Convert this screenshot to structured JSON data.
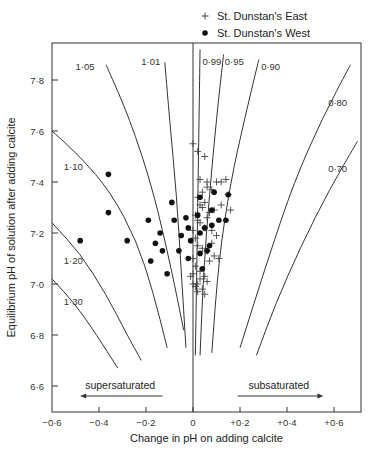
{
  "chart_data": {
    "type": "scatter",
    "title": "",
    "xlabel": "Change in pH on adding calcite",
    "ylabel": "Equilibrium pH of solution after adding calcite",
    "xlim": [
      -0.6,
      0.7
    ],
    "ylim": [
      6.49,
      7.94
    ],
    "x_ticks": [
      -0.6,
      -0.4,
      -0.2,
      0,
      0.2,
      0.4,
      0.6
    ],
    "x_tick_labels": [
      "−0·6",
      "−0·4",
      "−0·2",
      "0",
      "+0·2",
      "+0·4",
      "+0·6"
    ],
    "y_ticks": [
      6.6,
      6.8,
      7.0,
      7.2,
      7.4,
      7.6,
      7.8
    ],
    "y_tick_labels": [
      "6·6",
      "6·8",
      "7·0",
      "7·2",
      "7·4",
      "7·6",
      "7·8"
    ],
    "grid": false,
    "legend": {
      "position": "top-right, above plot",
      "entries": [
        {
          "marker": "+",
          "label": "St. Dunstan's East"
        },
        {
          "marker": "●",
          "label": "St. Dunstan's West"
        }
      ]
    },
    "annotations": [
      {
        "text": "supersaturated",
        "arrow": "left",
        "x": -0.3,
        "y": 6.6
      },
      {
        "text": "subsaturated",
        "arrow": "right",
        "x": 0.35,
        "y": 6.6
      }
    ],
    "saturation_curves": [
      {
        "label": "1·05",
        "points": [
          [
            -0.37,
            7.86
          ],
          [
            -0.27,
            7.65
          ],
          [
            -0.17,
            7.37
          ],
          [
            -0.09,
            7.05
          ],
          [
            -0.04,
            6.82
          ]
        ]
      },
      {
        "label": "1·01",
        "points": [
          [
            -0.12,
            7.87
          ],
          [
            -0.1,
            7.65
          ],
          [
            -0.07,
            7.35
          ],
          [
            -0.05,
            7.05
          ],
          [
            -0.03,
            6.75
          ]
        ]
      },
      {
        "label": "1·10",
        "points": [
          [
            -0.6,
            7.6
          ],
          [
            -0.48,
            7.5
          ],
          [
            -0.35,
            7.36
          ],
          [
            -0.24,
            7.17
          ],
          [
            -0.17,
            6.97
          ],
          [
            -0.11,
            6.75
          ]
        ]
      },
      {
        "label": "1·20",
        "points": [
          [
            -0.6,
            7.24
          ],
          [
            -0.48,
            7.12
          ],
          [
            -0.37,
            6.96
          ],
          [
            -0.28,
            6.8
          ],
          [
            -0.22,
            6.7
          ]
        ]
      },
      {
        "label": "1·30",
        "points": [
          [
            -0.6,
            7.02
          ],
          [
            -0.5,
            6.92
          ],
          [
            -0.41,
            6.8
          ],
          [
            -0.32,
            6.67
          ]
        ]
      },
      {
        "label": "0·99",
        "points": [
          [
            0.03,
            7.92
          ],
          [
            0.025,
            7.6
          ],
          [
            0.02,
            7.3
          ],
          [
            0.015,
            7.0
          ],
          [
            0.01,
            6.72
          ]
        ]
      },
      {
        "label": "0·95",
        "points": [
          [
            0.13,
            7.9
          ],
          [
            0.1,
            7.65
          ],
          [
            0.07,
            7.35
          ],
          [
            0.045,
            7.05
          ],
          [
            0.03,
            6.72
          ]
        ]
      },
      {
        "label": "0·90",
        "points": [
          [
            0.28,
            7.88
          ],
          [
            0.22,
            7.65
          ],
          [
            0.16,
            7.4
          ],
          [
            0.11,
            7.1
          ],
          [
            0.08,
            6.73
          ]
        ]
      },
      {
        "label": "0·80",
        "points": [
          [
            0.67,
            7.86
          ],
          [
            0.55,
            7.65
          ],
          [
            0.43,
            7.4
          ],
          [
            0.32,
            7.1
          ],
          [
            0.2,
            6.75
          ]
        ]
      },
      {
        "label": "0·70",
        "points": [
          [
            0.7,
            7.56
          ],
          [
            0.58,
            7.37
          ],
          [
            0.46,
            7.15
          ],
          [
            0.35,
            6.92
          ],
          [
            0.27,
            6.72
          ]
        ]
      }
    ],
    "series": [
      {
        "name": "St. Dunstan's East",
        "marker": "+",
        "x": [
          0.0,
          0.02,
          0.05,
          0.06,
          0.03,
          0.04,
          0.06,
          0.08,
          0.1,
          0.12,
          0.14,
          0.16,
          0.15,
          0.02,
          0.03,
          0.04,
          0.05,
          0.07,
          0.09,
          0.12,
          0.01,
          0.02,
          0.03,
          0.05,
          0.06,
          0.08,
          0.1,
          0.0,
          0.01,
          0.02,
          0.04,
          0.06,
          0.08,
          0.11,
          0.0,
          0.01,
          0.03,
          0.05,
          0.07,
          0.09,
          0.0,
          0.02,
          0.04,
          0.06,
          0.01,
          0.03,
          -0.01,
          0.02,
          0.0,
          0.05
        ],
        "y": [
          7.55,
          7.52,
          7.5,
          7.38,
          7.41,
          7.36,
          7.4,
          7.37,
          7.4,
          7.4,
          7.41,
          7.29,
          7.35,
          7.34,
          7.31,
          7.3,
          7.32,
          7.28,
          7.29,
          7.31,
          7.27,
          7.25,
          7.24,
          7.22,
          7.26,
          7.21,
          7.19,
          7.21,
          7.18,
          7.15,
          7.14,
          7.13,
          7.16,
          7.1,
          7.1,
          7.07,
          7.05,
          7.03,
          7.09,
          7.11,
          7.04,
          7.0,
          6.98,
          7.01,
          6.99,
          7.02,
          7.03,
          6.97,
          7.0,
          6.96
        ]
      },
      {
        "name": "St. Dunstan's West",
        "marker": "●",
        "x": [
          -0.48,
          -0.36,
          -0.36,
          -0.28,
          -0.19,
          -0.18,
          -0.16,
          -0.14,
          -0.13,
          -0.11,
          -0.09,
          -0.08,
          -0.06,
          -0.05,
          -0.03,
          -0.02,
          -0.02,
          -0.01,
          0.02,
          0.03,
          0.03,
          0.03,
          0.04,
          0.05,
          0.06,
          0.07,
          0.08,
          0.08,
          0.09,
          0.11,
          0.14,
          0.15
        ],
        "y": [
          7.17,
          7.43,
          7.28,
          7.17,
          7.25,
          7.09,
          7.16,
          7.2,
          7.13,
          7.04,
          7.32,
          7.25,
          7.13,
          7.19,
          7.26,
          7.22,
          7.1,
          7.17,
          7.27,
          7.34,
          7.2,
          7.12,
          7.06,
          7.22,
          7.13,
          7.15,
          7.29,
          7.23,
          7.36,
          7.25,
          7.25,
          7.35
        ]
      }
    ]
  }
}
